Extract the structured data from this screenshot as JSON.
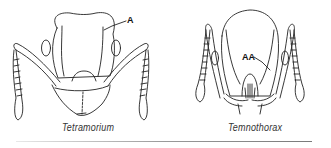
{
  "figure": {
    "panels": [
      {
        "caption": "Tetramorium",
        "label": "A"
      },
      {
        "caption": "Temnothorax",
        "label": "AA"
      }
    ],
    "line_color": "#222222",
    "rule_color": "#8a8a8a"
  }
}
